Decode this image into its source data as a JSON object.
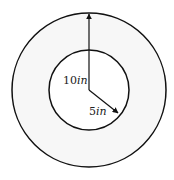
{
  "diagram": {
    "type": "concentric-circles",
    "outer_radius_label": "10in",
    "inner_radius_label": "5in",
    "outer_label_parts": {
      "num": "10",
      "unit": "in"
    },
    "inner_label_parts": {
      "num": "5",
      "unit": "in"
    },
    "colors": {
      "ring_fill": "#f7f7f7",
      "stroke": "#111111",
      "background": "#ffffff"
    }
  }
}
